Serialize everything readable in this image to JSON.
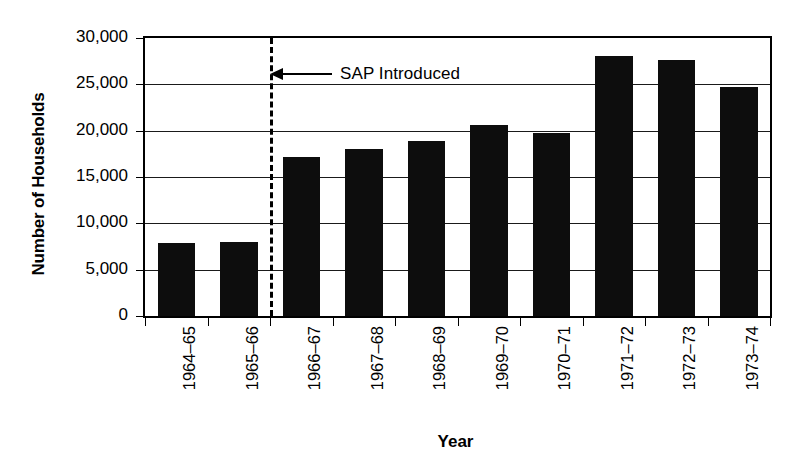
{
  "chart_data": {
    "type": "bar",
    "title": "",
    "xlabel": "Year",
    "ylabel": "Number of Households",
    "categories": [
      "1964–65",
      "1965–66",
      "1966–67",
      "1967–68",
      "1968–69",
      "1969–70",
      "1970–71",
      "1971–72",
      "1972–73",
      "1973–74"
    ],
    "values": [
      7900,
      7950,
      17200,
      18000,
      18900,
      20600,
      19800,
      28100,
      27600,
      24700
    ],
    "ylim": [
      0,
      30000
    ],
    "yticks": [
      0,
      5000,
      10000,
      15000,
      20000,
      25000,
      30000
    ],
    "ytick_labels": [
      "0",
      "5,000",
      "10,000",
      "15,000",
      "20,000",
      "25,000",
      "30,000"
    ],
    "grid": true,
    "legend": false,
    "bar_color": "#0d0d0d",
    "annotations": [
      {
        "text": "SAP Introduced",
        "type": "vertical-dashed-line-with-arrow",
        "between_categories": [
          "1965–66",
          "1966–67"
        ],
        "arrow_direction": "left"
      }
    ]
  }
}
